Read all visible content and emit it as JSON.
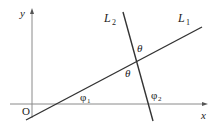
{
  "diagram": {
    "type": "geometry",
    "colors": {
      "axis": "#8a8a8a",
      "line": "#333333",
      "text": "#222222"
    },
    "axes": {
      "x_label": "x",
      "y_label": "y",
      "origin_label": "O"
    },
    "lines": [
      {
        "id": "L1",
        "label_main": "L",
        "label_sub": "1"
      },
      {
        "id": "L2",
        "label_main": "L",
        "label_sub": "2"
      }
    ],
    "angles": {
      "theta_top": "θ",
      "theta_bottom": "θ",
      "phi1_main": "φ",
      "phi1_sub": "1",
      "phi2_main": "φ",
      "phi2_sub": "2"
    }
  }
}
